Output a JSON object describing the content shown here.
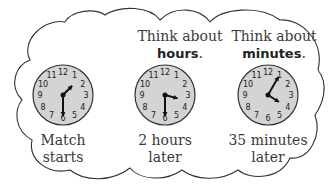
{
  "panels": [
    {
      "id": "match-starts",
      "header_line1": "",
      "header_bold": "",
      "clock": {
        "hour": 1,
        "minute": 30
      },
      "label_line1": "Match",
      "label_line2": "starts"
    },
    {
      "id": "two-hours-later",
      "header_line1": "Think about",
      "header_bold": "hours",
      "header_suffix": ".",
      "clock": {
        "hour": 3,
        "minute": 30
      },
      "label_line1": "2 hours",
      "label_line2": "later"
    },
    {
      "id": "35-minutes-later",
      "header_line1": "Think about",
      "header_bold": "minutes",
      "header_suffix": ".",
      "clock": {
        "hour": 4,
        "minute": 5
      },
      "label_line1": "35 minutes",
      "label_line2": "later"
    }
  ],
  "clock_numbers": [
    "12",
    "1",
    "2",
    "3",
    "4",
    "5",
    "6",
    "7",
    "8",
    "9",
    "10",
    "11"
  ],
  "colors": {
    "clock_face": "#d4d4d4",
    "outline": "#333333",
    "hands": "#111111"
  }
}
